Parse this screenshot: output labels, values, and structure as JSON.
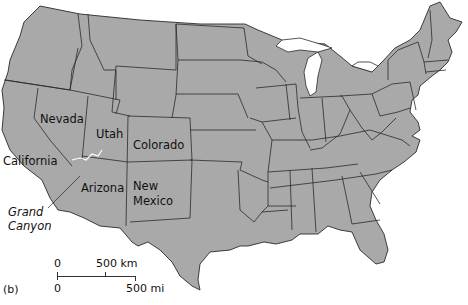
{
  "map": {
    "region": "Contiguous United States",
    "land_color": "#a9a9a9",
    "border_color": "#2a2a2a",
    "water_color": "#ffffff",
    "state_labels": [
      {
        "name": "Nevada",
        "x": 40,
        "y": 113
      },
      {
        "name": "Utah",
        "x": 96,
        "y": 126
      },
      {
        "name": "Colorado",
        "x": 133,
        "y": 138
      },
      {
        "name": "California",
        "x": 4,
        "y": 154
      },
      {
        "name": "Arizona",
        "x": 81,
        "y": 182
      },
      {
        "name": "New",
        "x": 133,
        "y": 181
      },
      {
        "name": "Mexico",
        "x": 133,
        "y": 195
      }
    ],
    "feature_labels": [
      {
        "name": "Grand",
        "x": 8,
        "y": 206
      },
      {
        "name": "Canyon",
        "x": 8,
        "y": 221
      }
    ]
  },
  "scale_bar": {
    "km_start": "0",
    "km_end": "500 km",
    "mi_start": "0",
    "mi_end": "500 mi"
  },
  "panel_label": "(b)"
}
